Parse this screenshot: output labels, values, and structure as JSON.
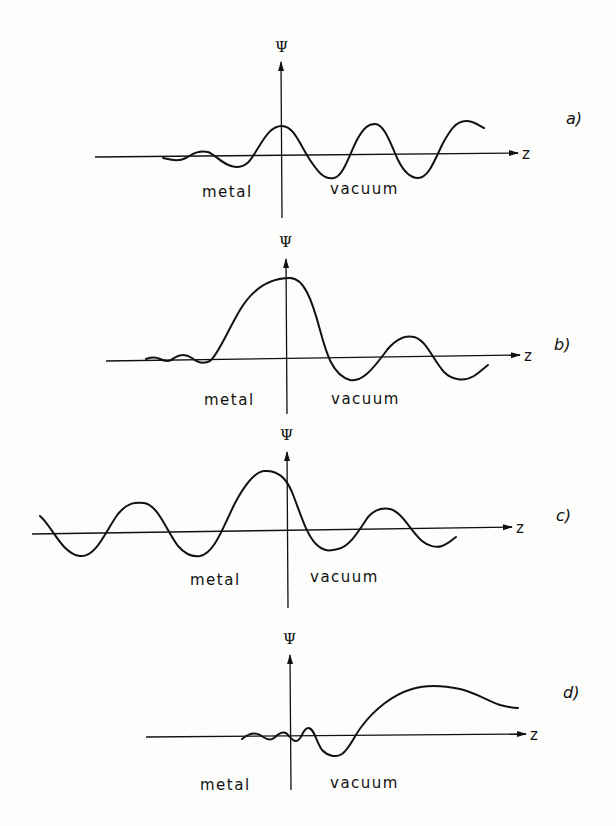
{
  "figure": {
    "panels": [
      {
        "id": "a",
        "tag": "a)",
        "y_label": "Ψ",
        "x_label": "z",
        "left_label": "metal",
        "right_label": "vacuum"
      },
      {
        "id": "b",
        "tag": "b)",
        "y_label": "Ψ",
        "x_label": "z",
        "left_label": "metal",
        "right_label": "vacuum"
      },
      {
        "id": "c",
        "tag": "c)",
        "y_label": "Ψ",
        "x_label": "z",
        "left_label": "metal",
        "right_label": "vacuum"
      },
      {
        "id": "d",
        "tag": "d)",
        "y_label": "Ψ",
        "x_label": "z",
        "left_label": "metal",
        "right_label": "vacuum"
      }
    ]
  }
}
